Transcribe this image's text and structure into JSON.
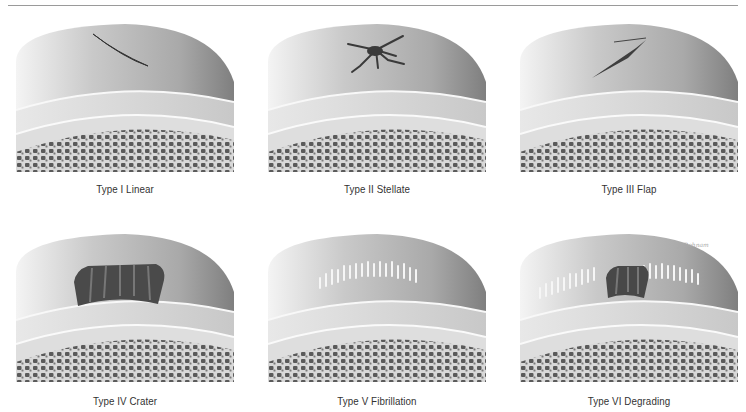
{
  "figure": {
    "signature": "J. Bohnam",
    "panels": [
      {
        "label": "Type I Linear",
        "tear": "linear"
      },
      {
        "label": "Type II Stellate",
        "tear": "stellate"
      },
      {
        "label": "Type III Flap",
        "tear": "flap"
      },
      {
        "label": "Type IV Crater",
        "tear": "crater"
      },
      {
        "label": "Type V Fibrillation",
        "tear": "fibrillation"
      },
      {
        "label": "Type VI Degrading",
        "tear": "degrading"
      }
    ]
  }
}
